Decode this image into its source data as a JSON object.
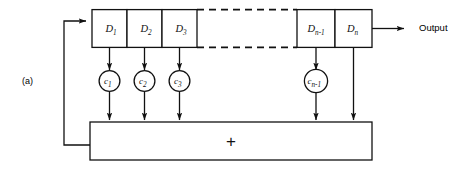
{
  "figure": {
    "panel_label": "(a)",
    "output_label": "Output",
    "adder_symbol": "+",
    "colors": {
      "stroke": "#111111",
      "background": "#ffffff"
    }
  },
  "delay_line": {
    "left_group": [
      {
        "base": "D",
        "subscript": "1"
      },
      {
        "base": "D",
        "subscript": "2"
      },
      {
        "base": "D",
        "subscript": "3"
      }
    ],
    "right_group": [
      {
        "base": "D",
        "subscript": "n-1"
      },
      {
        "base": "D",
        "subscript": "n"
      }
    ],
    "continuation": "dashed"
  },
  "coefficients": {
    "left_group": [
      {
        "base": "c",
        "subscript": "1"
      },
      {
        "base": "c",
        "subscript": "2"
      },
      {
        "base": "c",
        "subscript": "3"
      }
    ],
    "right_group": [
      {
        "base": "c",
        "subscript": "n-1"
      }
    ]
  }
}
